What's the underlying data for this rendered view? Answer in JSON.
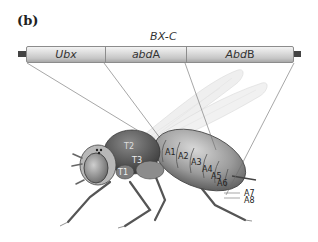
{
  "figure": {
    "panel_label": "(b)",
    "cluster_label": "BX-C",
    "genes": [
      {
        "italic": "Ubx",
        "plain": ""
      },
      {
        "italic": "abd",
        "plain": "A"
      },
      {
        "italic": "Abd",
        "plain": "B"
      }
    ],
    "segment_labels": {
      "thorax": [
        "T1",
        "T2",
        "T3"
      ],
      "abdomen": [
        "A1",
        "A2",
        "A3",
        "A4",
        "A5",
        "A6",
        "A7",
        "A8"
      ]
    },
    "colors": {
      "bar_fill": "#d4d4d4",
      "bar_border": "#8c8c8c",
      "line": "#707070",
      "body": "#9a9a9a"
    }
  }
}
